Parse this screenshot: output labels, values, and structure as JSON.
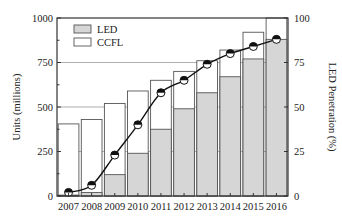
{
  "chart_data": {
    "type": "bar",
    "subtype": "overlapping-bars-with-line",
    "title": "",
    "categories": [
      "2007",
      "2008",
      "2009",
      "2010",
      "2011",
      "2012",
      "2013",
      "2014",
      "2015",
      "2016"
    ],
    "series": [
      {
        "name": "CCFL",
        "kind": "bar",
        "axis": "left",
        "note": "total bar height (outline)",
        "values": [
          405,
          430,
          520,
          590,
          650,
          700,
          760,
          820,
          920,
          1000
        ]
      },
      {
        "name": "LED",
        "kind": "bar",
        "axis": "left",
        "values": [
          5,
          20,
          120,
          240,
          375,
          490,
          580,
          670,
          770,
          880
        ]
      },
      {
        "name": "LED Penetration",
        "kind": "line",
        "axis": "right",
        "marker": "half-filled circle",
        "values": [
          2,
          6,
          23,
          40,
          58,
          65,
          74,
          80,
          84,
          88
        ]
      }
    ],
    "xlabel": "",
    "ylabel": "Units (millions)",
    "ylabel_right": "LED Penetration (%)",
    "ylim": [
      0,
      1000
    ],
    "ylim_right": [
      0,
      100
    ],
    "yticks": [
      0,
      250,
      500,
      750,
      1000
    ],
    "yticks_right": [
      0,
      25,
      50,
      75,
      100
    ],
    "grid": "horizontal at major ticks",
    "legend": {
      "position": "upper-left",
      "entries": [
        "LED",
        "CCFL"
      ]
    },
    "colors": {
      "LED": "#d6d6d6",
      "CCFL": "#ffffff",
      "line": "#111111",
      "axis": "#333333",
      "grid": "#9a9a9a"
    }
  }
}
